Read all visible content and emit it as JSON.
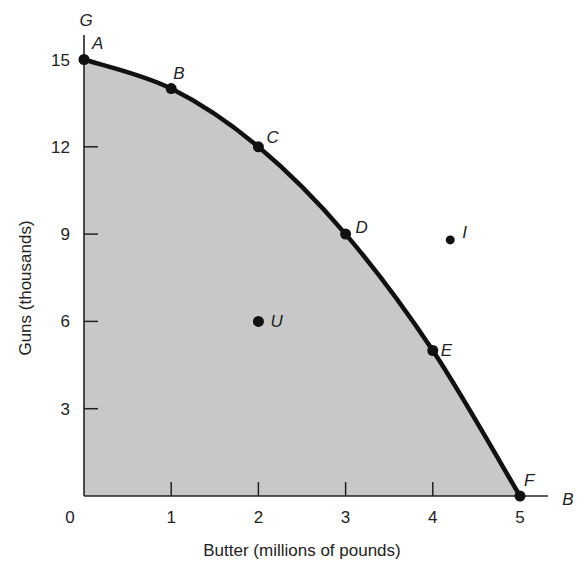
{
  "chart_data": {
    "type": "line",
    "title": "",
    "subtitle": "Production possibilities frontier (guns vs. butter)",
    "xlabel": "Butter (millions of pounds)",
    "ylabel": "Guns (thousands)",
    "x_axis_end_label": "B",
    "y_axis_end_label": "G",
    "xlim": [
      0,
      5
    ],
    "ylim": [
      0,
      15
    ],
    "x_ticks": [
      0,
      1,
      2,
      3,
      4,
      5
    ],
    "y_ticks": [
      3,
      6,
      9,
      12,
      15
    ],
    "grid": false,
    "legend": "none",
    "area_fill": "#c8c8c8",
    "series": [
      {
        "name": "PPF",
        "color": "#111111",
        "points": [
          {
            "label": "A",
            "x": 0,
            "y": 15
          },
          {
            "label": "B",
            "x": 1,
            "y": 14
          },
          {
            "label": "C",
            "x": 2,
            "y": 12
          },
          {
            "label": "D",
            "x": 3,
            "y": 9
          },
          {
            "label": "E",
            "x": 4,
            "y": 5
          },
          {
            "label": "F",
            "x": 5,
            "y": 0
          }
        ]
      }
    ],
    "annotations": [
      {
        "label": "U",
        "x": 2,
        "y": 6,
        "note": "inside frontier (unemployment/inefficient)"
      },
      {
        "label": "I",
        "x": 4.2,
        "y": 8.8,
        "note": "outside frontier (impossible)"
      }
    ]
  }
}
